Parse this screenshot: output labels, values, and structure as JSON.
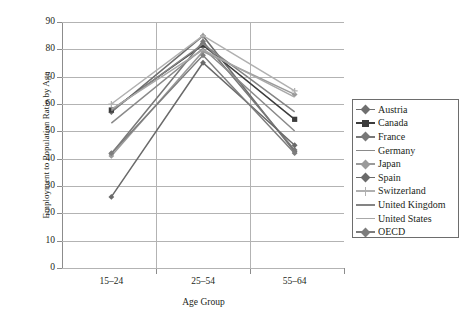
{
  "chart_data": {
    "type": "line",
    "title": "",
    "xlabel": "Age Group",
    "ylabel": "Employment to Population Ratio by Age",
    "categories": [
      "15–24",
      "25–54",
      "55–64"
    ],
    "ylim": [
      0,
      90
    ],
    "yticks": [
      0,
      10,
      20,
      30,
      40,
      50,
      60,
      70,
      80,
      90
    ],
    "grid": true,
    "legend_position": "right",
    "series": [
      {
        "name": "Austria",
        "values": [
          57.0,
          84.9,
          42.5
        ],
        "color": "#6f6f6f",
        "marker": "diamond"
      },
      {
        "name": "Canada",
        "values": [
          57.8,
          81.5,
          54.4
        ],
        "color": "#3c3c3c",
        "marker": "square"
      },
      {
        "name": "France",
        "values": [
          41.8,
          82.9,
          43.2
        ],
        "color": "#787878",
        "marker": "diamond"
      },
      {
        "name": "Germany",
        "values": [
          53.0,
          80.3,
          50.1
        ],
        "color": "#8a8a8a",
        "marker": "line"
      },
      {
        "name": "Japan",
        "values": [
          41.0,
          79.2,
          63.5
        ],
        "color": "#9a9a9a",
        "marker": "diamond"
      },
      {
        "name": "Spain",
        "values": [
          26.0,
          75.1,
          44.9
        ],
        "color": "#6a6a6a",
        "marker": "diamond"
      },
      {
        "name": "Switzerland",
        "values": [
          60.0,
          85.0,
          64.8
        ],
        "color": "#b0b0b0",
        "marker": "cross"
      },
      {
        "name": "United Kingdom",
        "values": [
          57.5,
          82.0,
          57.1
        ],
        "color": "#848484",
        "marker": "line"
      },
      {
        "name": "United States",
        "values": [
          58.0,
          79.8,
          62.5
        ],
        "color": "#a8a8a8",
        "marker": "line"
      },
      {
        "name": "OECD",
        "values": [
          42.0,
          77.8,
          42.0
        ],
        "color": "#7d7d7d",
        "marker": "diamond"
      }
    ]
  },
  "legend": {
    "items": [
      {
        "label": "Austria"
      },
      {
        "label": "Canada"
      },
      {
        "label": "France"
      },
      {
        "label": "Germany"
      },
      {
        "label": "Japan"
      },
      {
        "label": "Spain"
      },
      {
        "label": "Switzerland"
      },
      {
        "label": "United Kingdom"
      },
      {
        "label": "United States"
      },
      {
        "label": "OECD"
      }
    ]
  },
  "axes": {
    "y_title": "Employment to Population Ratio by Age",
    "x_title": "Age Group",
    "y_tick_labels": [
      "90",
      "80",
      "70",
      "60",
      "50",
      "40",
      "30",
      "20",
      "10",
      "0"
    ],
    "x_tick_labels": [
      "15–24",
      "25–54",
      "55–64"
    ]
  },
  "colors": {
    "axis": "#8c8c8c",
    "grid": "#b3b3b3",
    "text": "#231f20",
    "background": "#ffffff",
    "legend_border": "#6d6d6d"
  }
}
